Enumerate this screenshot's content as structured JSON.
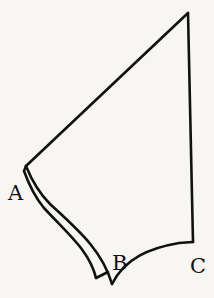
{
  "figure": {
    "labels": {
      "a": "A",
      "b": "B",
      "c": "C"
    },
    "colors": {
      "background": "#f7f6f2",
      "stroke": "#111111"
    }
  }
}
